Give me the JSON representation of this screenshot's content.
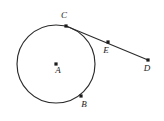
{
  "figure": {
    "kind": "geometry-diagram",
    "background_color": "#ffffff",
    "stroke_color": "#2b2b2b",
    "label_color": "#1a1a1a",
    "width": 164,
    "height": 121
  },
  "circle": {
    "name": "circle-A",
    "center_x": 56,
    "center_y": 64,
    "radius": 39,
    "center_label": "A",
    "center_label_x": 58,
    "center_label_y": 73
  },
  "points": [
    {
      "id": "A",
      "label": "A",
      "x": 56,
      "y": 64,
      "label_x": 58,
      "label_y": 73,
      "role": "center",
      "has_dot": true
    },
    {
      "id": "C",
      "label": "C",
      "x": 66,
      "y": 26,
      "label_x": 64,
      "label_y": 18,
      "role": "tangent-point",
      "has_dot": true
    },
    {
      "id": "B",
      "label": "B",
      "x": 81,
      "y": 96,
      "label_x": 84,
      "label_y": 107,
      "role": "on-circle",
      "has_dot": true
    },
    {
      "id": "E",
      "label": "E",
      "x": 108,
      "y": 42,
      "label_x": 106,
      "label_y": 53,
      "role": "on-ray",
      "has_dot": true
    },
    {
      "id": "D",
      "label": "D",
      "x": 148,
      "y": 60,
      "label_x": 147,
      "label_y": 71,
      "role": "ray-endpoint",
      "has_dot": true
    }
  ],
  "segments": [
    {
      "id": "CD",
      "label": "C to D",
      "from": "C",
      "to": "D",
      "x1": 66,
      "y1": 26,
      "x2": 148,
      "y2": 60,
      "role": "tangent-ray"
    }
  ]
}
